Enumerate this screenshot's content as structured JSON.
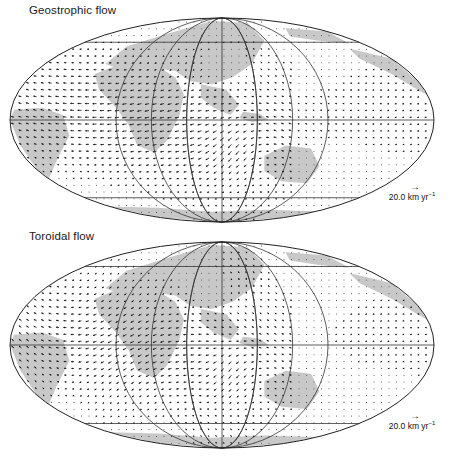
{
  "figure": {
    "panels": [
      {
        "id": "geostrophic",
        "title": "Geostrophic flow",
        "scale_value": "20.0",
        "scale_units": "km yr",
        "scale_exponent": "−1"
      },
      {
        "id": "toroidal",
        "title": "Toroidal flow",
        "scale_value": "20.0",
        "scale_units": "km yr",
        "scale_exponent": "−1"
      }
    ],
    "projection": "Mollweide (Hammer-type equal-area ellipse)",
    "graticule": {
      "meridian_spacing_deg": 30,
      "parallels_deg": [
        -60,
        0,
        60
      ]
    },
    "colors": {
      "land": "#c8c8c8",
      "ocean": "#ffffff",
      "grid": "#333333",
      "arrow": "#111111"
    },
    "scale_arrow_icon": "→"
  }
}
